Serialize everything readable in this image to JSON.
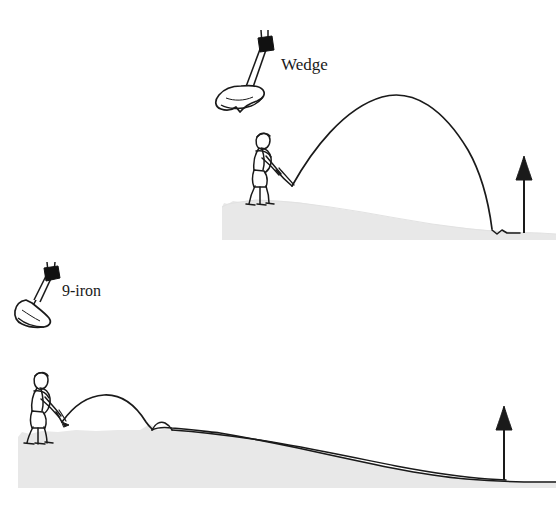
{
  "figure": {
    "background_color": "#ffffff",
    "ground_fill": "#e8e8e8",
    "ink_color": "#1a1a1a",
    "grip_color": "#111111"
  },
  "scenes": [
    {
      "id": "wedge-scene",
      "club_label": "Wedge",
      "club_name": "wedge-club-icon",
      "golfer_name": "golfer-figure",
      "flag_name": "flag-pin",
      "trajectory": {
        "type": "high-lofted-arc",
        "description": "high steep arc landing near the pin with almost no roll",
        "launch": [
          292,
          184
        ],
        "apex": [
          400,
          95
        ],
        "landing": [
          492,
          231
        ],
        "stop": [
          515,
          232
        ]
      },
      "ground": {
        "start_x": 222,
        "crest_y": 200,
        "end_x": 556,
        "base_y": 234,
        "description": "gentle downslope from golfer to green"
      }
    },
    {
      "id": "nine-iron-scene",
      "club_label": "9-iron",
      "club_name": "nine-iron-club-icon",
      "golfer_name": "golfer-figure",
      "flag_name": "flag-pin",
      "trajectory": {
        "type": "low-running-arc",
        "description": "lower arc landing short then running a long way to the pin",
        "launch": [
          62,
          420
        ],
        "apex": [
          105,
          396
        ],
        "landing": [
          152,
          428
        ],
        "bounce_apex": [
          163,
          423
        ],
        "stop": [
          504,
          478
        ]
      },
      "ground": {
        "start_x": 18,
        "plateau_y": 430,
        "end_x": 556,
        "base_y": 481,
        "description": "flat lie rising to a plateau then falling away to the green"
      }
    }
  ],
  "labels": {
    "wedge": "Wedge",
    "nine_iron": "9-iron"
  },
  "colors": {
    "ink": "#1a1a1a",
    "ground": "#e8e8e8",
    "grip": "#111111",
    "page": "#ffffff"
  }
}
